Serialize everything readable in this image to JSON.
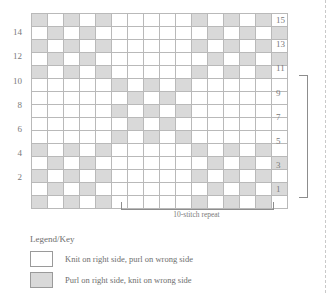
{
  "chart_data": {
    "type": "heatmap",
    "title": "",
    "xlabel": "",
    "ylabel": "",
    "rows": 15,
    "cols": 16,
    "legend_position": "bottom-left",
    "grid": true,
    "cell_symbols": {
      "0": "knit-on-right-side",
      "1": "purl-on-right-side"
    },
    "colors": {
      "knit": "#ffffff",
      "purl": "#d9d9d9",
      "grid_line": "#b9b9b9",
      "border": "#9a9a9a",
      "text": "#6e6e6e"
    },
    "row_numbers_left": [
      14,
      12,
      10,
      8,
      6,
      4,
      2
    ],
    "row_numbers_right": [
      15,
      13,
      11,
      9,
      7,
      5,
      3,
      1
    ],
    "values_top_to_bottom": [
      [
        1,
        0,
        1,
        0,
        1,
        0,
        0,
        0,
        0,
        0,
        1,
        0,
        1,
        0,
        1,
        0
      ],
      [
        0,
        1,
        0,
        1,
        0,
        0,
        0,
        0,
        0,
        0,
        0,
        1,
        0,
        1,
        0,
        1
      ],
      [
        1,
        0,
        1,
        0,
        1,
        0,
        0,
        0,
        0,
        0,
        1,
        0,
        1,
        0,
        1,
        0
      ],
      [
        0,
        1,
        0,
        1,
        0,
        0,
        0,
        0,
        0,
        0,
        0,
        1,
        0,
        1,
        0,
        1
      ],
      [
        1,
        0,
        1,
        0,
        1,
        0,
        0,
        0,
        0,
        0,
        1,
        0,
        1,
        0,
        1,
        0
      ],
      [
        0,
        0,
        0,
        0,
        0,
        1,
        0,
        1,
        0,
        1,
        0,
        0,
        0,
        0,
        0,
        0
      ],
      [
        0,
        0,
        0,
        0,
        0,
        0,
        1,
        0,
        1,
        0,
        0,
        0,
        0,
        0,
        0,
        0
      ],
      [
        0,
        0,
        0,
        0,
        0,
        1,
        0,
        1,
        0,
        1,
        0,
        0,
        0,
        0,
        0,
        0
      ],
      [
        0,
        0,
        0,
        0,
        0,
        0,
        1,
        0,
        1,
        0,
        0,
        0,
        0,
        0,
        0,
        0
      ],
      [
        0,
        0,
        0,
        0,
        0,
        1,
        0,
        1,
        0,
        1,
        0,
        0,
        0,
        0,
        0,
        0
      ],
      [
        1,
        0,
        1,
        0,
        1,
        0,
        0,
        0,
        0,
        0,
        1,
        0,
        1,
        0,
        1,
        0
      ],
      [
        0,
        1,
        0,
        1,
        0,
        0,
        0,
        0,
        0,
        0,
        0,
        1,
        0,
        1,
        0,
        1
      ],
      [
        1,
        0,
        1,
        0,
        1,
        0,
        0,
        0,
        0,
        0,
        1,
        0,
        1,
        0,
        1,
        0
      ],
      [
        0,
        1,
        0,
        1,
        0,
        0,
        0,
        0,
        0,
        0,
        0,
        1,
        0,
        1,
        0,
        1
      ],
      [
        1,
        0,
        1,
        0,
        1,
        0,
        0,
        0,
        0,
        0,
        1,
        0,
        1,
        0,
        1,
        0
      ]
    ]
  },
  "repeats": {
    "stitch_label": "10-stitch repeat",
    "row_label": "10-row repeat"
  },
  "legend": {
    "title": "Legend/Key",
    "items": [
      {
        "swatch": "knit",
        "text": "Knit on right side, purl on wrong side"
      },
      {
        "swatch": "purl",
        "text": "Purl on right side, knit on wrong side"
      }
    ]
  }
}
